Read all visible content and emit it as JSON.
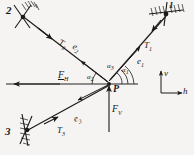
{
  "figure": {
    "background_color": "#f5f4f2",
    "ink_color": "#1a1a18"
  },
  "nodes": [
    {
      "id": "1",
      "label": "1",
      "role": "anchor-support-top-right"
    },
    {
      "id": "2",
      "label": "2",
      "role": "anchor-support-top-left"
    },
    {
      "id": "3",
      "label": "3",
      "role": "anchor-support-bottom-left"
    },
    {
      "id": "P",
      "label": "P",
      "role": "junction-point"
    }
  ],
  "tensions": [
    {
      "name": "T",
      "sub": "1",
      "rope": "1"
    },
    {
      "name": "T",
      "sub": "2",
      "rope": "2"
    },
    {
      "name": "T",
      "sub": "3",
      "rope": "3"
    }
  ],
  "unit_vectors": [
    {
      "name": "e",
      "sub": "1",
      "rope": "1"
    },
    {
      "name": "e",
      "sub": "2",
      "rope": "2"
    },
    {
      "name": "e",
      "sub": "3",
      "rope": "3"
    }
  ],
  "angles": [
    {
      "name": "α",
      "sub": "1",
      "measured_from": "h-axis"
    },
    {
      "name": "α",
      "sub": "2",
      "measured_from": "h-axis"
    },
    {
      "name": "α",
      "sub": "3",
      "measured_from": "h-axis"
    }
  ],
  "forces": [
    {
      "name": "F",
      "sub": "H",
      "direction": "horizontal-left"
    },
    {
      "name": "F",
      "sub": "V",
      "direction": "vertical-down"
    }
  ],
  "axes": {
    "horizontal": {
      "label": "h",
      "direction": "right"
    },
    "vertical": {
      "label": "v",
      "direction": "up"
    }
  }
}
